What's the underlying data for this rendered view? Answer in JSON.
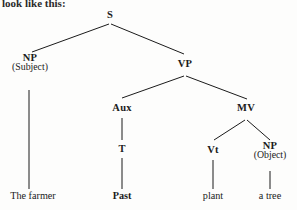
{
  "page": {
    "width": 297,
    "height": 210,
    "background_color": "#fdfdfc",
    "ink_color": "#1b1b1b"
  },
  "caption": {
    "text": "look like this:"
  },
  "diagram": {
    "type": "syntax-tree",
    "sentence": "The farmer Past plant a tree",
    "nodes": [
      {
        "id": "S",
        "label": "S",
        "sublabel": "",
        "x": 110,
        "y": 15,
        "kind": "category"
      },
      {
        "id": "NP_SUBJ",
        "label": "NP",
        "sublabel": "(Subject)",
        "x": 30,
        "y": 62,
        "kind": "category"
      },
      {
        "id": "VP",
        "label": "VP",
        "sublabel": "",
        "x": 185,
        "y": 64,
        "kind": "category"
      },
      {
        "id": "AUX",
        "label": "Aux",
        "sublabel": "",
        "x": 122,
        "y": 108,
        "kind": "category"
      },
      {
        "id": "MV",
        "label": "MV",
        "sublabel": "",
        "x": 246,
        "y": 108,
        "kind": "category"
      },
      {
        "id": "T",
        "label": "T",
        "sublabel": "",
        "x": 122,
        "y": 149,
        "kind": "category"
      },
      {
        "id": "VT",
        "label": "Vt",
        "sublabel": "",
        "x": 213,
        "y": 150,
        "kind": "category"
      },
      {
        "id": "NP_OBJ",
        "label": "NP",
        "sublabel": "(Object)",
        "x": 270,
        "y": 150,
        "kind": "category"
      },
      {
        "id": "W_FARMER",
        "label": "The farmer",
        "sublabel": "",
        "x": 33,
        "y": 196,
        "kind": "terminal"
      },
      {
        "id": "W_PAST",
        "label": "Past",
        "sublabel": "",
        "x": 122,
        "y": 196,
        "kind": "terminal-bold"
      },
      {
        "id": "W_PLANT",
        "label": "plant",
        "sublabel": "",
        "x": 213,
        "y": 196,
        "kind": "terminal"
      },
      {
        "id": "W_TREE",
        "label": "a tree",
        "sublabel": "",
        "x": 270,
        "y": 196,
        "kind": "terminal"
      }
    ],
    "edges": [
      {
        "from": "S",
        "to": "NP_SUBJ",
        "x1": 109,
        "y1": 24,
        "x2": 32,
        "y2": 52
      },
      {
        "from": "S",
        "to": "VP",
        "x1": 111,
        "y1": 24,
        "x2": 184,
        "y2": 54
      },
      {
        "from": "VP",
        "to": "AUX",
        "x1": 184,
        "y1": 76,
        "x2": 122,
        "y2": 98
      },
      {
        "from": "VP",
        "to": "MV",
        "x1": 186,
        "y1": 76,
        "x2": 247,
        "y2": 99
      },
      {
        "from": "NP_SUBJ",
        "to": "W_FARMER",
        "x1": 29,
        "y1": 90,
        "x2": 29,
        "y2": 189
      },
      {
        "from": "AUX",
        "to": "T",
        "x1": 122,
        "y1": 118,
        "x2": 122,
        "y2": 140
      },
      {
        "from": "MV",
        "to": "VT",
        "x1": 245,
        "y1": 120,
        "x2": 214,
        "y2": 140
      },
      {
        "from": "MV",
        "to": "NP_OBJ",
        "x1": 247,
        "y1": 120,
        "x2": 270,
        "y2": 140
      },
      {
        "from": "T",
        "to": "W_PAST",
        "x1": 122,
        "y1": 158,
        "x2": 122,
        "y2": 189
      },
      {
        "from": "VT",
        "to": "W_PLANT",
        "x1": 213,
        "y1": 160,
        "x2": 213,
        "y2": 189
      },
      {
        "from": "NP_OBJ",
        "to": "W_TREE",
        "x1": 270,
        "y1": 171,
        "x2": 270,
        "y2": 189
      }
    ]
  }
}
